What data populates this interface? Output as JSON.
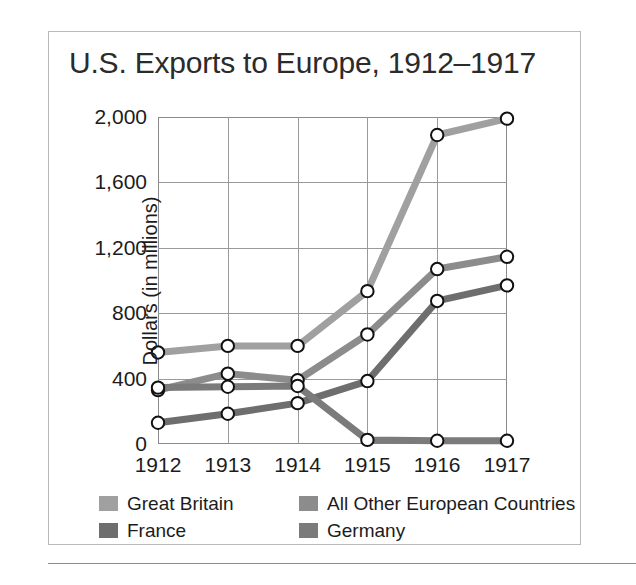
{
  "chart_data": {
    "type": "line",
    "title": "U.S. Exports to Europe, 1912–1917",
    "xlabel": "",
    "ylabel": "Dollars (in millions)",
    "categories": [
      "1912",
      "1913",
      "1914",
      "1915",
      "1916",
      "1917"
    ],
    "x_tick_labels": [
      "1912",
      "1913",
      "1914",
      "1915",
      "1916",
      "1917"
    ],
    "y_tick_labels": [
      "0",
      "400",
      "800",
      "1,200",
      "1,600",
      "2,000"
    ],
    "y_ticks": [
      0,
      400,
      800,
      1200,
      1600,
      2000
    ],
    "ylim": [
      0,
      2000
    ],
    "grid": true,
    "legend_position": "bottom",
    "markers": "open-circle",
    "series": [
      {
        "name": "Great Britain",
        "color": "#a0a0a0",
        "values": [
          560,
          600,
          600,
          935,
          1890,
          1990
        ]
      },
      {
        "name": "All Other European Countries",
        "color": "#8c8c8c",
        "values": [
          330,
          430,
          390,
          670,
          1070,
          1145
        ]
      },
      {
        "name": "France",
        "color": "#6e6e6e",
        "values": [
          130,
          185,
          250,
          385,
          875,
          970
        ]
      },
      {
        "name": "Germany",
        "color": "#7b7b7b",
        "values": [
          345,
          350,
          355,
          25,
          20,
          20
        ]
      }
    ]
  },
  "legend": {
    "entries": [
      {
        "label": "Great Britain",
        "color": "#a0a0a0"
      },
      {
        "label": "All Other European Countries",
        "color": "#8c8c8c"
      },
      {
        "label": "France",
        "color": "#6e6e6e"
      },
      {
        "label": "Germany",
        "color": "#7b7b7b"
      }
    ]
  }
}
